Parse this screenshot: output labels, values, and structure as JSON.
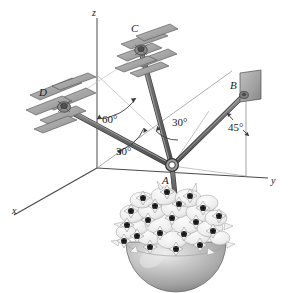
{
  "figure": {
    "background": "#ffffff",
    "axes": {
      "x_label": "x",
      "y_label": "y",
      "z_label": "z"
    },
    "points": {
      "A": "A",
      "B": "B",
      "C": "C",
      "D": "D"
    },
    "angles": {
      "ac_from_z": "60°",
      "ac_in_plane": "30°",
      "ad_in_plane": "30°",
      "ab_from_vertical": "45°"
    },
    "colors": {
      "rod": "#6f6f6f",
      "rod_dark": "#4a4a4a",
      "rod_light": "#9a9a9a",
      "plate": "#a8a8a8",
      "plate_dark": "#8a8a8a",
      "plate_edge": "#555555",
      "axis": "#4a4a4a",
      "dashed": "#9b9b9b",
      "bowl": "#b9b9b9",
      "bowl_dark": "#8f8f8f",
      "bowl_light": "#e2e2e2",
      "petal": "#f2f2f2",
      "petal_edge": "#8e8e8e",
      "flower_center": "#3a3a3a",
      "text": "#1a1a1a"
    },
    "elements": {
      "joint_a": "ring-joint",
      "support_b": "wall-plate",
      "support_c": "brick-bracket",
      "support_d": "brick-bracket",
      "basket": "hanging-flower-basket",
      "rod_ab": "rod",
      "rod_ac": "rod",
      "rod_ad": "rod",
      "hanger": "basket-hanger-rod"
    }
  }
}
